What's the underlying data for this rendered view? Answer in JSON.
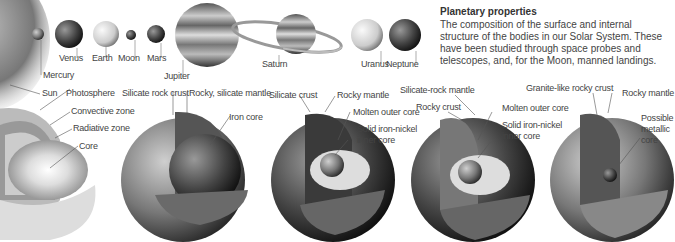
{
  "header": {
    "title": "Planetary properties",
    "description": "The composition of the surface and internal structure of the bodies in our Solar System. These have been studied through space probes and telescopes, and, for the Moon, manned landings."
  },
  "planets": [
    {
      "name": "Mercury"
    },
    {
      "name": "Venus"
    },
    {
      "name": "Earth"
    },
    {
      "name": "Moon"
    },
    {
      "name": "Mars"
    },
    {
      "name": "Jupiter"
    },
    {
      "name": "Saturn"
    },
    {
      "name": "Uranus"
    },
    {
      "name": "Neptune"
    }
  ],
  "cross_sections": {
    "sun": {
      "name": "Sun",
      "layers": [
        "Photosphere",
        "Convective zone",
        "Radiative zone",
        "Core"
      ]
    },
    "mercury": {
      "layers": [
        "Silicate rock crust",
        "Rocky, silicate mantle",
        "Iron core"
      ]
    },
    "venus": {
      "layers": [
        "Silicate crust",
        "Rocky mantle",
        "Molten outer core",
        "Solid iron-nickel",
        "inner core"
      ]
    },
    "earth": {
      "layers": [
        "Silicate-rock mantle",
        "Rocky crust",
        "Molten outer core",
        "Solid iron-nickel",
        "inner core"
      ]
    },
    "moon": {
      "layers": [
        "Granite-like rocky crust",
        "Rocky mantle",
        "Possible",
        "metallic",
        "core"
      ]
    }
  }
}
